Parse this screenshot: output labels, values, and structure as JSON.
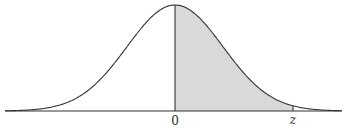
{
  "diagram": {
    "type": "normal-distribution-curve",
    "shaded_region": {
      "from": "0",
      "to": "z",
      "fill": "#d9d9d9"
    },
    "labels": {
      "zero": "0",
      "z": "z"
    },
    "colors": {
      "curve": "#333333",
      "shade": "#d9d9d9",
      "background": "#ffffff"
    }
  }
}
